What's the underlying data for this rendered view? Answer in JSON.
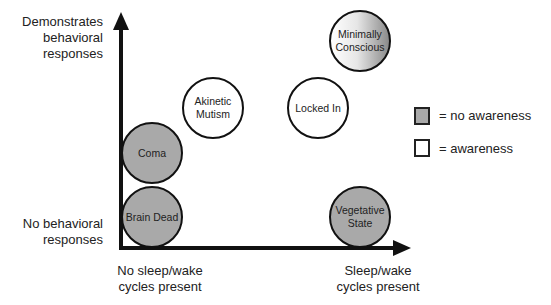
{
  "axes": {
    "y_top_label": [
      "Demonstrates",
      "behavioral",
      "responses"
    ],
    "y_bottom_label": [
      "No behavioral",
      "responses"
    ],
    "x_left_label": [
      "No sleep/wake",
      "cycles present"
    ],
    "x_right_label": [
      "Sleep/wake",
      "cycles present"
    ]
  },
  "states": [
    {
      "name": "Minimally Conscious",
      "lines": [
        "Minimally",
        "Conscious"
      ],
      "fill": "gradient",
      "awareness": "partial"
    },
    {
      "name": "Akinetic Mutism",
      "lines": [
        "Akinetic",
        "Mutism"
      ],
      "fill": "#ffffff",
      "awareness": "awareness"
    },
    {
      "name": "Locked In",
      "lines": [
        "Locked In"
      ],
      "fill": "#ffffff",
      "awareness": "awareness"
    },
    {
      "name": "Coma",
      "lines": [
        "Coma"
      ],
      "fill": "#a9a9a9",
      "awareness": "no awareness"
    },
    {
      "name": "Brain Dead",
      "lines": [
        "Brain Dead"
      ],
      "fill": "#a9a9a9",
      "awareness": "no awareness"
    },
    {
      "name": "Vegetative State",
      "lines": [
        "Vegetative",
        "State"
      ],
      "fill": "#a9a9a9",
      "awareness": "no awareness"
    }
  ],
  "legend": [
    {
      "swatch": "#a9a9a9",
      "label": "= no awareness"
    },
    {
      "swatch": "#ffffff",
      "label": "= awareness"
    }
  ]
}
